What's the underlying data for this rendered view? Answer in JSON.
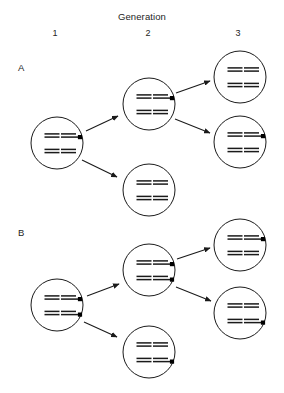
{
  "figure": {
    "header_title": "Generation",
    "generation_labels": [
      {
        "id": "gen-1",
        "label": "1",
        "x": 55,
        "column_center": 55
      },
      {
        "id": "gen-2",
        "label": "2",
        "x": 148,
        "column_center": 148
      },
      {
        "id": "gen-3",
        "label": "3",
        "x": 238,
        "column_center": 238
      }
    ],
    "panels": [
      {
        "id": "panel-a",
        "label": "A",
        "x": 18,
        "y": 72
      },
      {
        "id": "panel-b",
        "label": "B",
        "x": 18,
        "y": 237
      }
    ],
    "colors": {
      "stroke": "#1a1a1a",
      "marker_fill": "#000000",
      "background": "#ffffff",
      "text": "#242424"
    },
    "cell_radius": 26,
    "chromosome": {
      "upper_line_length": 15,
      "lower_line_length": 15,
      "lower_line_extension": 4,
      "line_gap": 3.2,
      "marker_size": 4.2
    }
  },
  "chart_data": {
    "type": "diagram",
    "title": "Generation",
    "columns": [
      "1",
      "2",
      "3"
    ],
    "panels": [
      {
        "name": "A",
        "cells": [
          {
            "id": "a-gen1",
            "generation": 1,
            "cx": 57,
            "cy": 143,
            "marker_count": 1,
            "chromosomes": [
              {
                "position": "top-left",
                "marked": false
              },
              {
                "position": "top-right",
                "marked": true
              },
              {
                "position": "bottom-left",
                "marked": false
              },
              {
                "position": "bottom-right",
                "marked": false
              }
            ]
          },
          {
            "id": "a-gen2-upper",
            "generation": 2,
            "cx": 149,
            "cy": 104,
            "marker_count": 1,
            "chromosomes": [
              {
                "position": "top-left",
                "marked": false
              },
              {
                "position": "top-right",
                "marked": true
              },
              {
                "position": "bottom-left",
                "marked": false
              },
              {
                "position": "bottom-right",
                "marked": false
              }
            ]
          },
          {
            "id": "a-gen2-lower",
            "generation": 2,
            "cx": 149,
            "cy": 190,
            "marker_count": 0,
            "chromosomes": [
              {
                "position": "top-left",
                "marked": false
              },
              {
                "position": "top-right",
                "marked": false
              },
              {
                "position": "bottom-left",
                "marked": false
              },
              {
                "position": "bottom-right",
                "marked": false
              }
            ]
          },
          {
            "id": "a-gen3-upper",
            "generation": 3,
            "cx": 240,
            "cy": 77,
            "marker_count": 0,
            "chromosomes": [
              {
                "position": "top-left",
                "marked": false
              },
              {
                "position": "top-right",
                "marked": false
              },
              {
                "position": "bottom-left",
                "marked": false
              },
              {
                "position": "bottom-right",
                "marked": false
              }
            ]
          },
          {
            "id": "a-gen3-lower",
            "generation": 3,
            "cx": 240,
            "cy": 142,
            "marker_count": 1,
            "chromosomes": [
              {
                "position": "top-left",
                "marked": false
              },
              {
                "position": "top-right",
                "marked": true
              },
              {
                "position": "bottom-left",
                "marked": false
              },
              {
                "position": "bottom-right",
                "marked": false
              }
            ]
          }
        ],
        "arrows": [
          {
            "id": "a-arrow-1",
            "from": "a-gen1",
            "to": "a-gen2-upper",
            "x1": 86,
            "y1": 131,
            "x2": 118,
            "y2": 116
          },
          {
            "id": "a-arrow-2",
            "from": "a-gen1",
            "to": "a-gen2-lower",
            "x1": 82,
            "y1": 160,
            "x2": 117,
            "y2": 177
          },
          {
            "id": "a-arrow-3",
            "from": "a-gen2-upper",
            "to": "a-gen3-upper",
            "x1": 176,
            "y1": 93,
            "x2": 210,
            "y2": 81
          },
          {
            "id": "a-arrow-4",
            "from": "a-gen2-upper",
            "to": "a-gen3-lower",
            "x1": 175,
            "y1": 119,
            "x2": 210,
            "y2": 133
          }
        ]
      },
      {
        "name": "B",
        "cells": [
          {
            "id": "b-gen1",
            "generation": 1,
            "cx": 57,
            "cy": 305,
            "marker_count": 2,
            "chromosomes": [
              {
                "position": "top-left",
                "marked": false
              },
              {
                "position": "top-right",
                "marked": true
              },
              {
                "position": "bottom-left",
                "marked": false
              },
              {
                "position": "bottom-right",
                "marked": true
              }
            ]
          },
          {
            "id": "b-gen2-upper",
            "generation": 2,
            "cx": 149,
            "cy": 270,
            "marker_count": 2,
            "chromosomes": [
              {
                "position": "top-left",
                "marked": false
              },
              {
                "position": "top-right",
                "marked": true
              },
              {
                "position": "bottom-left",
                "marked": false
              },
              {
                "position": "bottom-right",
                "marked": true
              }
            ]
          },
          {
            "id": "b-gen2-lower",
            "generation": 2,
            "cx": 149,
            "cy": 352,
            "marker_count": 1,
            "chromosomes": [
              {
                "position": "top-left",
                "marked": false
              },
              {
                "position": "top-right",
                "marked": false
              },
              {
                "position": "bottom-left",
                "marked": false
              },
              {
                "position": "bottom-right",
                "marked": true
              }
            ]
          },
          {
            "id": "b-gen3-upper",
            "generation": 3,
            "cx": 240,
            "cy": 245,
            "marker_count": 1,
            "chromosomes": [
              {
                "position": "top-left",
                "marked": false
              },
              {
                "position": "top-right",
                "marked": true
              },
              {
                "position": "bottom-left",
                "marked": false
              },
              {
                "position": "bottom-right",
                "marked": false
              }
            ]
          },
          {
            "id": "b-gen3-lower",
            "generation": 3,
            "cx": 240,
            "cy": 313,
            "marker_count": 1,
            "chromosomes": [
              {
                "position": "top-left",
                "marked": false
              },
              {
                "position": "top-right",
                "marked": false
              },
              {
                "position": "bottom-left",
                "marked": false
              },
              {
                "position": "bottom-right",
                "marked": true
              }
            ]
          }
        ],
        "arrows": [
          {
            "id": "b-arrow-1",
            "from": "b-gen1",
            "to": "b-gen2-upper",
            "x1": 87,
            "y1": 296,
            "x2": 119,
            "y2": 284
          },
          {
            "id": "b-arrow-2",
            "from": "b-gen1",
            "to": "b-gen2-lower",
            "x1": 84,
            "y1": 322,
            "x2": 117,
            "y2": 337
          },
          {
            "id": "b-arrow-3",
            "from": "b-gen2-upper",
            "to": "b-gen3-upper",
            "x1": 177,
            "y1": 259,
            "x2": 210,
            "y2": 248
          },
          {
            "id": "b-arrow-4",
            "from": "b-gen2-upper",
            "to": "b-gen3-lower",
            "x1": 176,
            "y1": 287,
            "x2": 211,
            "y2": 301
          }
        ]
      }
    ]
  }
}
